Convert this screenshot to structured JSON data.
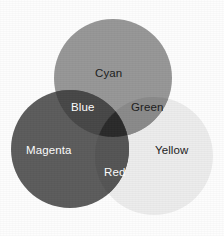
{
  "figure": {
    "background_color": "#fdfdfd"
  },
  "chart_data": {
    "type": "venn",
    "title": "",
    "subtitle": "",
    "xlabel": "",
    "ylabel": "",
    "grid": false,
    "legend": "none",
    "set_count": 3,
    "canvas": {
      "width": 224,
      "height": 236
    },
    "sets": [
      {
        "name": "Cyan",
        "label": "Cyan",
        "cx": 113,
        "cy": 78,
        "r": 59,
        "fill": "#979797",
        "text_color": "#1d1d1d",
        "label_x": 95,
        "label_y": 68
      },
      {
        "name": "Magenta",
        "label": "Magenta",
        "cx": 70,
        "cy": 149,
        "r": 59,
        "fill": "#5b5b5b",
        "text_color": "#fbfbfb",
        "label_x": 26,
        "label_y": 145
      },
      {
        "name": "Yellow",
        "label": "Yellow",
        "cx": 154,
        "cy": 156,
        "r": 59,
        "fill": "#ececec",
        "text_color": "#1d1d1d",
        "label_x": 155,
        "label_y": 145
      }
    ],
    "intersections": [
      {
        "name": "Blue",
        "label": "Blue",
        "of": [
          "Cyan",
          "Magenta"
        ],
        "fill": "#464646",
        "text_color": "#fbfbfb",
        "label_x": 71,
        "label_y": 102
      },
      {
        "name": "Green",
        "label": "Green",
        "of": [
          "Cyan",
          "Yellow"
        ],
        "fill": "#8a8a8a",
        "text_color": "#1d1d1d",
        "label_x": 131,
        "label_y": 102
      },
      {
        "name": "Red",
        "label": "Red",
        "of": [
          "Magenta",
          "Yellow"
        ],
        "fill": "#555555",
        "text_color": "#fbfbfb",
        "label_x": 104,
        "label_y": 167
      },
      {
        "name": "Black",
        "label": "",
        "of": [
          "Cyan",
          "Magenta",
          "Yellow"
        ],
        "fill": "#2c2c2c",
        "text_color": "#fbfbfb",
        "label_x": 0,
        "label_y": 0
      }
    ],
    "labels": [
      "Cyan",
      "Green",
      "Blue",
      "Magenta",
      "Red",
      "Yellow"
    ],
    "colors": {
      "cyan": "#979797",
      "magenta": "#5b5b5b",
      "yellow": "#ececec",
      "blue": "#464646",
      "green": "#8a8a8a",
      "red": "#555555",
      "black": "#2c2c2c",
      "background": "#fdfdfd",
      "dark_text": "#1d1d1d",
      "light_text": "#fbfbfb"
    }
  }
}
